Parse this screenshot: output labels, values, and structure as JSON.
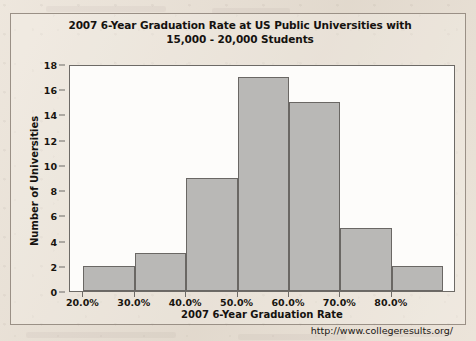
{
  "chart_data": {
    "type": "bar",
    "title": "2007 6-Year Graduation Rate at US Public Universities with 15,000 - 20,000 Students",
    "title_line1": "2007 6-Year Graduation Rate at US Public Universities with",
    "title_line2": "15,000 - 20,000 Students",
    "xlabel": "2007 6-Year Graduation Rate",
    "ylabel": "Number of Universities",
    "categories": [
      "20.0%-30.0%",
      "30.0%-40.0%",
      "40.0%-50.0%",
      "50.0%-60.0%",
      "60.0%-70.0%",
      "70.0%-80.0%",
      "80.0%-90.0%"
    ],
    "bin_edges": [
      20,
      30,
      40,
      50,
      60,
      70,
      80,
      90
    ],
    "values": [
      2,
      3,
      9,
      17,
      15,
      5,
      2
    ],
    "xlim": [
      17.4,
      92.5
    ],
    "ylim": [
      0,
      18
    ],
    "x_tick_values": [
      20,
      30,
      40,
      50,
      60,
      70,
      80
    ],
    "x_tick_labels": [
      "20.0%",
      "30.0%",
      "40.0%",
      "50.0%",
      "60.0%",
      "70.0%",
      "80.0%"
    ],
    "y_tick_labels": [
      "0",
      "2",
      "4",
      "6",
      "8",
      "10",
      "12",
      "14",
      "16",
      "18"
    ],
    "y_tick_values": [
      0,
      2,
      4,
      6,
      8,
      10,
      12,
      14,
      16,
      18
    ],
    "grid": false,
    "legend": false,
    "bar_fill_color": "#b9b8b6",
    "bar_edge_color": "#6a6764",
    "plot_background": "#fdfcfa",
    "page_background": "#e9e0d4",
    "source": "http://www.collegeresults.org/"
  }
}
